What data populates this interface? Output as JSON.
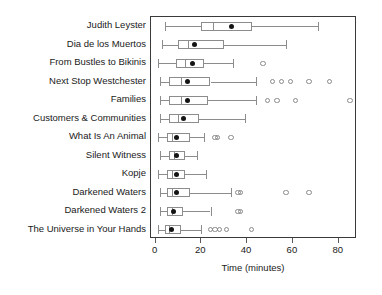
{
  "chart_data": {
    "type": "box",
    "title": "",
    "xlabel": "Time (minutes)",
    "ylabel": "",
    "xlim": [
      -2,
      88
    ],
    "xticks": [
      0,
      20,
      40,
      60,
      80
    ],
    "xticklabels": [
      "0",
      "20",
      "40",
      "60",
      "80"
    ],
    "grid": false,
    "legend": null,
    "orientation": "horizontal",
    "marker_note": "filled black dot = mean; open circles = outliers",
    "categories": [
      "Judith Leyster",
      "Dia de los Muertos",
      "From Bustles to Bikinis",
      "Next Stop Westchester",
      "Families",
      "Customers & Communities",
      "What Is An Animal",
      "Silent Witness",
      "Kopje",
      "Darkened Waters",
      "Darkened Waters 2",
      "The Universe in Your Hands"
    ],
    "boxes": [
      {
        "category": "Judith Leyster",
        "whisker_low": 4,
        "q1": 20,
        "median": 25,
        "q3": 42,
        "whisker_high": 71,
        "mean": 33,
        "outliers": []
      },
      {
        "category": "Dia de los Muertos",
        "whisker_low": 3,
        "q1": 10,
        "median": 14,
        "q3": 30,
        "whisker_high": 57,
        "mean": 17,
        "outliers": []
      },
      {
        "category": "From Bustles to Bikinis",
        "whisker_low": 1,
        "q1": 9,
        "median": 13,
        "q3": 21,
        "whisker_high": 34,
        "mean": 16,
        "outliers": [
          47
        ]
      },
      {
        "category": "Next Stop Westchester",
        "whisker_low": 2,
        "q1": 6,
        "median": 11,
        "q3": 24,
        "whisker_high": 44,
        "mean": 14,
        "outliers": [
          51,
          55,
          59,
          67,
          76
        ]
      },
      {
        "category": "Families",
        "whisker_low": 2,
        "q1": 6,
        "median": 11,
        "q3": 23,
        "whisker_high": 44,
        "mean": 14,
        "outliers": [
          49,
          53,
          61,
          85
        ]
      },
      {
        "category": "Customers & Communities",
        "whisker_low": 2,
        "q1": 6,
        "median": 10,
        "q3": 19,
        "whisker_high": 39,
        "mean": 12,
        "outliers": []
      },
      {
        "category": "What Is An Animal",
        "whisker_low": 1,
        "q1": 5,
        "median": 7,
        "q3": 15,
        "whisker_high": 21,
        "mean": 9,
        "outliers": [
          26,
          27,
          33
        ]
      },
      {
        "category": "Silent Witness",
        "whisker_low": 2,
        "q1": 6,
        "median": 8,
        "q3": 13,
        "whisker_high": 18,
        "mean": 9,
        "outliers": []
      },
      {
        "category": "Kopje",
        "whisker_low": 1,
        "q1": 5,
        "median": 7,
        "q3": 13,
        "whisker_high": 22,
        "mean": 9,
        "outliers": []
      },
      {
        "category": "Darkened Waters",
        "whisker_low": 2,
        "q1": 5,
        "median": 7,
        "q3": 15,
        "whisker_high": 33,
        "mean": 9,
        "outliers": [
          36,
          37,
          57,
          67
        ]
      },
      {
        "category": "Darkened Waters 2",
        "whisker_low": 2,
        "q1": 5,
        "median": 7,
        "q3": 12,
        "whisker_high": 24,
        "mean": 8,
        "outliers": [
          36,
          37
        ]
      },
      {
        "category": "The Universe in Your Hands",
        "whisker_low": 1,
        "q1": 4,
        "median": 6,
        "q3": 11,
        "whisker_high": 20,
        "mean": 7,
        "outliers": [
          24,
          26,
          28,
          31,
          42
        ]
      }
    ]
  },
  "axis": {
    "x_title": "Time (minutes)"
  },
  "colors": {
    "box_stroke": "#8c8c8c",
    "mean_marker": "#141414",
    "outlier_stroke": "#8a8a8a",
    "frame": "#3a3a3a",
    "text": "#1a1a1a",
    "background": "#ffffff"
  }
}
